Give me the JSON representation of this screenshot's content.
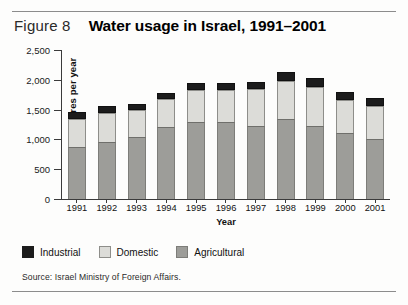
{
  "figure": {
    "label": "Figure 8",
    "title": "Water usage in Israel, 1991–2001",
    "source": "Source: Israel Ministry of Foreign Affairs."
  },
  "legend": [
    {
      "name": "industrial",
      "label": "Industrial",
      "color": "#1c1c1c"
    },
    {
      "name": "domestic",
      "label": "Domestic",
      "color": "#dcdcd8"
    },
    {
      "name": "agricultural",
      "label": "Agricultural",
      "color": "#9d9d99"
    }
  ],
  "axes": {
    "y_title": "Million cubic metres per year",
    "x_title": "Year",
    "y_ticks": [
      "0",
      "500",
      "1,000",
      "1,500",
      "2,000",
      "2,500"
    ]
  },
  "chart_data": {
    "type": "bar",
    "stacked": true,
    "title": "Water usage in Israel, 1991–2001",
    "subtitle": "Figure 8",
    "xlabel": "Year",
    "ylabel": "Million cubic metres per year",
    "ylim": [
      0,
      2500
    ],
    "yticks": [
      0,
      500,
      1000,
      1500,
      2000,
      2500
    ],
    "grid": false,
    "legend_position": "bottom-left",
    "source": "Source: Israel Ministry of Foreign Affairs.",
    "categories": [
      "1991",
      "1992",
      "1993",
      "1994",
      "1995",
      "1996",
      "1997",
      "1998",
      "1999",
      "2000",
      "2001"
    ],
    "series": [
      {
        "name": "Agricultural",
        "color": "#9d9d99",
        "values": [
          870,
          950,
          1040,
          1200,
          1290,
          1290,
          1230,
          1340,
          1230,
          1100,
          1000
        ]
      },
      {
        "name": "Domestic",
        "color": "#dcdcd8",
        "values": [
          480,
          500,
          450,
          480,
          540,
          540,
          620,
          640,
          650,
          560,
          560
        ]
      },
      {
        "name": "Industrial",
        "color": "#1c1c1c",
        "values": [
          110,
          110,
          100,
          100,
          120,
          120,
          120,
          150,
          150,
          140,
          130
        ]
      }
    ],
    "totals": [
      1460,
      1560,
      1590,
      1780,
      1950,
      1950,
      1970,
      2130,
      2030,
      1800,
      1690
    ]
  }
}
